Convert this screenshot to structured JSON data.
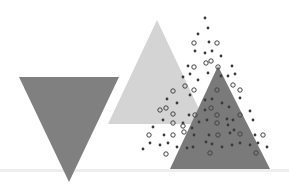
{
  "scene": {
    "title": "Abstract triangles with scattered dots",
    "background": "#ffffff",
    "ground_line": {
      "y": 170,
      "color": "#eeeeee"
    },
    "shapes": [
      {
        "name": "inverted-dark-triangle",
        "points": "19,77 119,77 69,182",
        "fill": "#808080"
      },
      {
        "name": "light-triangle",
        "points": "157,20 108,124 206,124",
        "fill": "#d4d4d4"
      },
      {
        "name": "dark-triangle-right",
        "points": "218,66 170,169 270,169",
        "fill": "#7a7a7a"
      }
    ],
    "dot_style": {
      "radius": 1.4,
      "ring_radius": 2.2,
      "fill": "#3a3a3a",
      "ring_stroke": "#444444"
    },
    "dots": [
      [
        205,
        18,
        0
      ],
      [
        208,
        28,
        0
      ],
      [
        198,
        34,
        0
      ],
      [
        194,
        43,
        1
      ],
      [
        209,
        42,
        0
      ],
      [
        217,
        43,
        1
      ],
      [
        195,
        51,
        0
      ],
      [
        205,
        53,
        0
      ],
      [
        212,
        51,
        0
      ],
      [
        221,
        56,
        0
      ],
      [
        206,
        63,
        1
      ],
      [
        211,
        61,
        1
      ],
      [
        194,
        67,
        1
      ],
      [
        218,
        67,
        1
      ],
      [
        188,
        66,
        0
      ],
      [
        232,
        66,
        0
      ],
      [
        190,
        74,
        0
      ],
      [
        183,
        77,
        0
      ],
      [
        208,
        73,
        0
      ],
      [
        221,
        76,
        0
      ],
      [
        228,
        76,
        0
      ],
      [
        235,
        74,
        0
      ],
      [
        198,
        80,
        0
      ],
      [
        185,
        86,
        1
      ],
      [
        194,
        90,
        1
      ],
      [
        233,
        85,
        1
      ],
      [
        240,
        90,
        1
      ],
      [
        217,
        90,
        1
      ],
      [
        173,
        91,
        1
      ],
      [
        190,
        95,
        0
      ],
      [
        205,
        100,
        0
      ],
      [
        167,
        99,
        0
      ],
      [
        177,
        103,
        0
      ],
      [
        212,
        99,
        0
      ],
      [
        222,
        103,
        0
      ],
      [
        240,
        98,
        0
      ],
      [
        229,
        107,
        0
      ],
      [
        211,
        108,
        1
      ],
      [
        205,
        110,
        0
      ],
      [
        160,
        110,
        1
      ],
      [
        166,
        108,
        1
      ],
      [
        173,
        114,
        1
      ],
      [
        250,
        111,
        0
      ],
      [
        217,
        115,
        1
      ],
      [
        240,
        115,
        1
      ],
      [
        195,
        115,
        1
      ],
      [
        189,
        115,
        0
      ],
      [
        163,
        120,
        0
      ],
      [
        173,
        123,
        1
      ],
      [
        183,
        123,
        0
      ],
      [
        199,
        122,
        0
      ],
      [
        207,
        120,
        0
      ],
      [
        227,
        119,
        0
      ],
      [
        233,
        120,
        0
      ],
      [
        253,
        120,
        0
      ],
      [
        153,
        127,
        0
      ],
      [
        183,
        126,
        1
      ],
      [
        192,
        128,
        0
      ],
      [
        217,
        123,
        1
      ],
      [
        228,
        125,
        0
      ],
      [
        234,
        130,
        0
      ],
      [
        149,
        135,
        1
      ],
      [
        164,
        135,
        0
      ],
      [
        173,
        135,
        1
      ],
      [
        184,
        132,
        1
      ],
      [
        194,
        135,
        0
      ],
      [
        209,
        135,
        0
      ],
      [
        218,
        135,
        1
      ],
      [
        230,
        133,
        0
      ],
      [
        240,
        134,
        1
      ],
      [
        255,
        135,
        0
      ],
      [
        263,
        135,
        1
      ],
      [
        150,
        143,
        0
      ],
      [
        160,
        145,
        0
      ],
      [
        168,
        143,
        0
      ],
      [
        177,
        147,
        0
      ],
      [
        206,
        142,
        0
      ],
      [
        212,
        144,
        0
      ],
      [
        222,
        147,
        0
      ],
      [
        232,
        145,
        0
      ],
      [
        240,
        143,
        0
      ],
      [
        250,
        145,
        0
      ],
      [
        258,
        143,
        0
      ],
      [
        267,
        147,
        0
      ],
      [
        143,
        149,
        0
      ],
      [
        166,
        154,
        1
      ],
      [
        210,
        153,
        1
      ],
      [
        256,
        153,
        1
      ],
      [
        187,
        148,
        0
      ],
      [
        193,
        147,
        0
      ]
    ]
  }
}
